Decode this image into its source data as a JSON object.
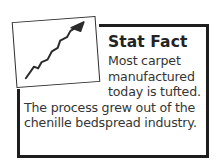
{
  "callout": {
    "title": "Stat Fact",
    "body": "Most carpet manufactured today is tufted. The process grew out of the chenille bedspread industry.",
    "icon": {
      "name": "upward-trend-chart-icon",
      "description": "tilted white box containing a rising zigzag arrow"
    },
    "colors": {
      "frame": "#1d1d1d",
      "title_text": "#232323",
      "body_text": "#353535",
      "icon_stroke": "#2f2f2f",
      "background": "#ffffff"
    }
  }
}
